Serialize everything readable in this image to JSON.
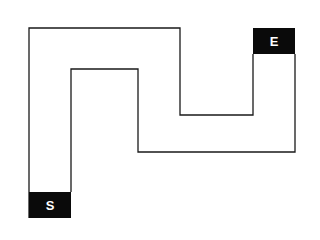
{
  "diagram": {
    "type": "maze-path",
    "start_label": "S",
    "end_label": "E",
    "colors": {
      "line": "#1a1a1a",
      "marker_bg": "#0a0a0a",
      "marker_text": "#ffffff",
      "background": "#ffffff"
    }
  }
}
